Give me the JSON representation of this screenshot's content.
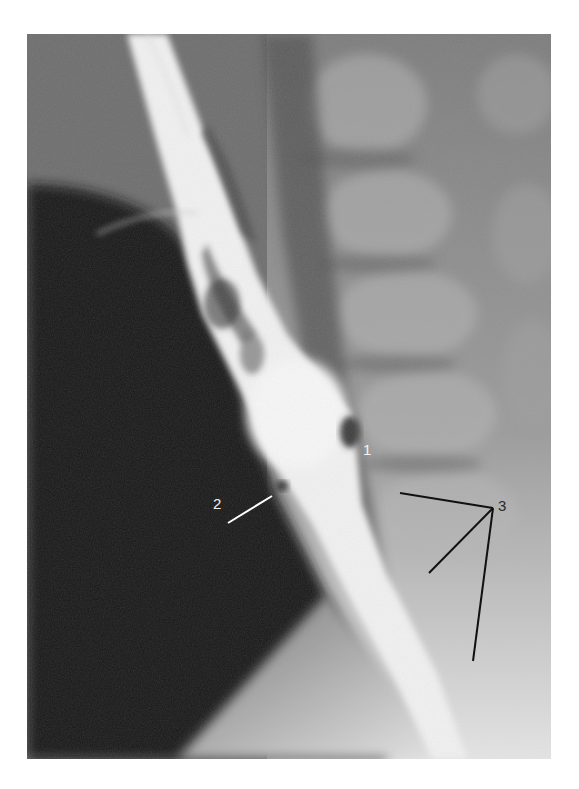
{
  "figure": {
    "labels": [
      {
        "id": "1",
        "text": "1",
        "color": "#f2f2f2"
      },
      {
        "id": "2",
        "text": "2",
        "color": "#f2f2f2"
      },
      {
        "id": "3",
        "text": "3",
        "color": "#2a2a2a"
      }
    ],
    "colors": {
      "background": "#ffffff",
      "dark_air": "#161616",
      "soft_tissue": "#6a6a6a",
      "bone": "#a8a8a8",
      "barium": "#f4f4f4",
      "leader_light": "#ffffff",
      "leader_dark": "#111111"
    }
  }
}
